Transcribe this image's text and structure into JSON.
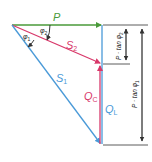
{
  "diagram": {
    "colors": {
      "active_power": "#4a9a3a",
      "apparent_power_1": "#4a9ad8",
      "apparent_power_2": "#d8386a",
      "dimension": "#333333"
    },
    "labels": {
      "P": "P",
      "S1_main": "S",
      "S1_sub": "1",
      "S2_main": "S",
      "S2_sub": "2",
      "QC_main": "Q",
      "QC_sub": "C",
      "QL_main": "Q",
      "QL_sub": "L",
      "phi1_main": "φ",
      "phi1_sub": "1",
      "phi2_main": "φ",
      "phi2_sub": "2",
      "dim_short": "P · tan φ",
      "dim_short_sub": "2",
      "dim_long": "P · tan φ",
      "dim_long_sub": "1"
    }
  }
}
